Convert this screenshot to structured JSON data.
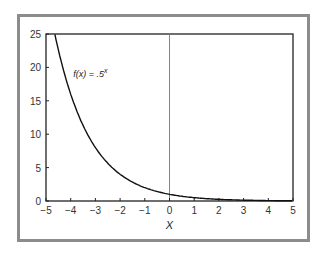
{
  "chart_data": {
    "type": "line",
    "title": "",
    "xlabel": "X",
    "ylabel": "",
    "xlim": [
      -5,
      5
    ],
    "ylim": [
      0,
      25
    ],
    "x_ticks": [
      "−5",
      "−4",
      "−3",
      "−2",
      "−1",
      "0",
      "1",
      "2",
      "3",
      "4",
      "5"
    ],
    "y_ticks": [
      "0",
      "5",
      "10",
      "15",
      "20",
      "25"
    ],
    "grid": false,
    "legend": null,
    "annotations": [
      {
        "text": "f(x) = .5",
        "superscript": "x",
        "x": -3.9,
        "y": 18.5
      }
    ],
    "vertical_reference_line": {
      "x": 0
    },
    "series": [
      {
        "name": "f(x) = .5^x",
        "x": [
          -4.64,
          -4.5,
          -4,
          -3.5,
          -3,
          -2.5,
          -2,
          -1.5,
          -1,
          -0.5,
          0,
          0.5,
          1,
          1.5,
          2,
          2.5,
          3,
          3.5,
          4,
          4.5,
          5
        ],
        "values": [
          25,
          22.6,
          16,
          11.3,
          8,
          5.66,
          4,
          2.83,
          2,
          1.41,
          1,
          0.71,
          0.5,
          0.35,
          0.25,
          0.18,
          0.13,
          0.09,
          0.06,
          0.04,
          0.03
        ]
      }
    ]
  }
}
